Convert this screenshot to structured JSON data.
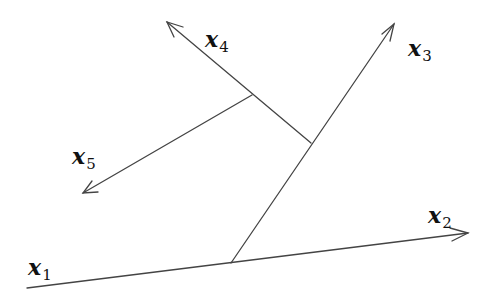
{
  "diagram": {
    "type": "vector-decomposition",
    "stroke_color": "#444444",
    "background": "#ffffff",
    "vectors": [
      {
        "id": "x1",
        "label_var": "x",
        "label_sub": "1",
        "from": [
          27,
          288
        ],
        "to": [
          231,
          263
        ],
        "arrow": false
      },
      {
        "id": "x2",
        "label_var": "x",
        "label_sub": "2",
        "from": [
          231,
          263
        ],
        "to": [
          468,
          233
        ],
        "arrow": true
      },
      {
        "id": "x3",
        "label_var": "x",
        "label_sub": "3",
        "from": [
          231,
          263
        ],
        "to": [
          394,
          24
        ],
        "arrow": true
      },
      {
        "id": "x4",
        "label_var": "x",
        "label_sub": "4",
        "from": [
          311,
          143
        ],
        "to": [
          167,
          22
        ],
        "arrow": true
      },
      {
        "id": "x5",
        "label_var": "x",
        "label_sub": "5",
        "from": [
          252,
          95
        ],
        "to": [
          83,
          193
        ],
        "arrow": true
      }
    ],
    "labels": {
      "x1": {
        "var": "x",
        "sub": "1"
      },
      "x2": {
        "var": "x",
        "sub": "2"
      },
      "x3": {
        "var": "x",
        "sub": "3"
      },
      "x4": {
        "var": "x",
        "sub": "4"
      },
      "x5": {
        "var": "x",
        "sub": "5"
      }
    }
  }
}
